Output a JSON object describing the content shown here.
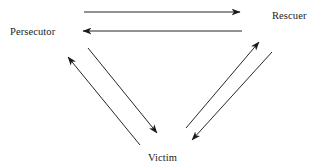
{
  "diagram": {
    "background_color": "#ffffff",
    "stroke_color": "#1a1a1a",
    "text_color": "#1a1a1a",
    "nodes": [
      {
        "id": "persecutor",
        "label": "Persecutor",
        "x": 10,
        "y": 26
      },
      {
        "id": "rescuer",
        "label": "Rescuer",
        "x": 272,
        "y": 10
      },
      {
        "id": "victim",
        "label": "Victim",
        "x": 148,
        "y": 152
      }
    ],
    "arrows": [
      {
        "id": "persecutor-to-rescuer",
        "from": "persecutor",
        "to": "rescuer",
        "direction": "right",
        "x1": 84,
        "y1": 12,
        "x2": 240,
        "y2": 12
      },
      {
        "id": "rescuer-to-persecutor",
        "from": "rescuer",
        "to": "persecutor",
        "direction": "left",
        "x1": 242,
        "y1": 31,
        "x2": 83,
        "y2": 31
      },
      {
        "id": "victim-to-persecutor",
        "from": "victim",
        "to": "persecutor",
        "direction": "up-left",
        "x1": 140,
        "y1": 145,
        "x2": 68,
        "y2": 57
      },
      {
        "id": "persecutor-to-victim",
        "from": "persecutor",
        "to": "victim",
        "direction": "down-right",
        "x1": 88,
        "y1": 48,
        "x2": 157,
        "y2": 133
      },
      {
        "id": "victim-to-rescuer",
        "from": "victim",
        "to": "rescuer",
        "direction": "up-right",
        "x1": 186,
        "y1": 128,
        "x2": 259,
        "y2": 42
      },
      {
        "id": "rescuer-to-victim",
        "from": "rescuer",
        "to": "victim",
        "direction": "down-left",
        "x1": 272,
        "y1": 52,
        "x2": 192,
        "y2": 140
      }
    ]
  }
}
